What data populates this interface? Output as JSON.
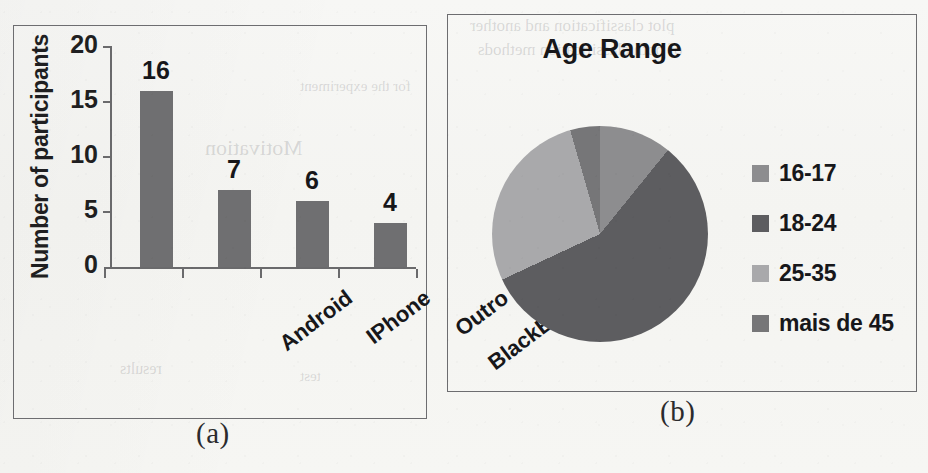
{
  "figure": {
    "caption_a": "(a)",
    "caption_b": "(b)"
  },
  "colors": {
    "bar_fill": "#6f6f71",
    "axis": "#6a6a6c",
    "text": "#17171a",
    "panel_border": "#6d6d70",
    "paper": "#f6f6f4",
    "slice_16_17": "#8d8d8f",
    "slice_18_24": "#5d5d60",
    "slice_25_35": "#a9a9ab",
    "slice_mais_de_45": "#767678"
  },
  "bleed_through": [
    {
      "text": "plot classification and another",
      "x": 470,
      "y": 16,
      "size": 17
    },
    {
      "text": "of both classification methods",
      "x": 478,
      "y": 40,
      "size": 17
    },
    {
      "text": "for the experiment",
      "x": 300,
      "y": 78,
      "size": 15
    },
    {
      "text": "Motivation",
      "x": 205,
      "y": 135,
      "size": 22
    },
    {
      "text": "results",
      "x": 120,
      "y": 360,
      "size": 16
    },
    {
      "text": "test",
      "x": 300,
      "y": 368,
      "size": 15
    }
  ],
  "chart_data": [
    {
      "type": "bar",
      "panel": "(a)",
      "title": "",
      "xlabel": "",
      "ylabel": "Number of participants",
      "categories": [
        "Android",
        "IPhone",
        "Outro",
        "BlackBerry"
      ],
      "values": [
        16,
        7,
        6,
        4
      ],
      "value_labels": [
        "16",
        "7",
        "6",
        "4"
      ],
      "yticks": [
        20,
        15,
        10,
        5,
        0
      ],
      "ylim": [
        0,
        20
      ],
      "grid": false,
      "legend": "none"
    },
    {
      "type": "pie",
      "panel": "(b)",
      "title": "Age Range",
      "labels": [
        "16-17",
        "18-24",
        "25-35",
        "mais de 45"
      ],
      "values": [
        10.8,
        57.2,
        27.4,
        4.6
      ],
      "angles_deg": [
        39,
        206,
        99,
        16
      ],
      "start_angle_deg": 0,
      "direction": "clockwise",
      "legend": "right"
    }
  ],
  "bar_chart": {
    "ylabel": "Number of participants",
    "yticks": [
      "20",
      "15",
      "10",
      "5",
      "0"
    ],
    "bars": [
      {
        "category": "Android",
        "value": "16"
      },
      {
        "category": "IPhone",
        "value": "7"
      },
      {
        "category": "Outro",
        "value": "6"
      },
      {
        "category": "BlackBerry",
        "value": "4"
      }
    ]
  },
  "pie_chart": {
    "title": "Age Range",
    "legend": [
      {
        "label": "16-17",
        "color": "#8d8d8f"
      },
      {
        "label": "18-24",
        "color": "#5d5d60"
      },
      {
        "label": "25-35",
        "color": "#a9a9ab"
      },
      {
        "label": "mais de 45",
        "color": "#767678"
      }
    ]
  }
}
